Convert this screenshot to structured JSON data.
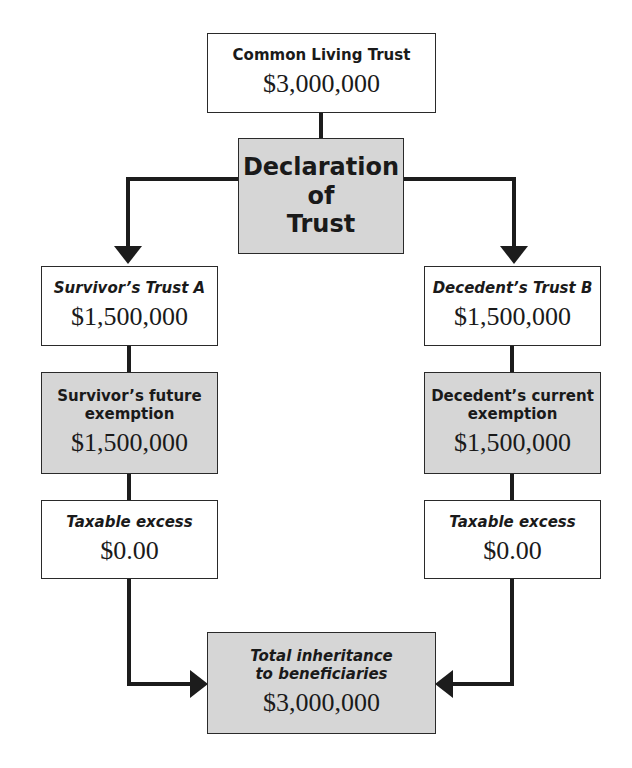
{
  "diagram": {
    "colors": {
      "box_border": "#2a2a2a",
      "shaded_fill": "#d6d6d6",
      "plain_fill": "#ffffff",
      "connector": "#1c1c1c"
    },
    "nodes": {
      "common_trust": {
        "label": "Common Living Trust",
        "amount": "$3,000,000"
      },
      "declaration": {
        "label_lines": [
          "Declaration",
          "of",
          "Trust"
        ]
      },
      "survivor_trust": {
        "label": "Survivor’s Trust A",
        "amount": "$1,500,000"
      },
      "decedent_trust": {
        "label": "Decedent’s Trust B",
        "amount": "$1,500,000"
      },
      "survivor_exemption": {
        "label_lines": [
          "Survivor’s future",
          "exemption"
        ],
        "amount": "$1,500,000"
      },
      "decedent_exemption": {
        "label_lines": [
          "Decedent’s current",
          "exemption"
        ],
        "amount": "$1,500,000"
      },
      "survivor_taxable": {
        "label": "Taxable excess",
        "amount": "$0.00"
      },
      "decedent_taxable": {
        "label": "Taxable excess",
        "amount": "$0.00"
      },
      "total_inheritance": {
        "label_lines": [
          "Total inheritance",
          "to beneficiaries"
        ],
        "amount": "$3,000,000"
      }
    },
    "edges": [
      {
        "from": "common_trust",
        "to": "declaration",
        "type": "line"
      },
      {
        "from": "declaration",
        "to": "survivor_trust",
        "type": "arrow"
      },
      {
        "from": "declaration",
        "to": "decedent_trust",
        "type": "arrow"
      },
      {
        "from": "survivor_trust",
        "to": "survivor_exemption",
        "type": "line"
      },
      {
        "from": "survivor_exemption",
        "to": "survivor_taxable",
        "type": "line"
      },
      {
        "from": "decedent_trust",
        "to": "decedent_exemption",
        "type": "line"
      },
      {
        "from": "decedent_exemption",
        "to": "decedent_taxable",
        "type": "line"
      },
      {
        "from": "survivor_taxable",
        "to": "total_inheritance",
        "type": "arrow"
      },
      {
        "from": "decedent_taxable",
        "to": "total_inheritance",
        "type": "arrow"
      }
    ]
  }
}
